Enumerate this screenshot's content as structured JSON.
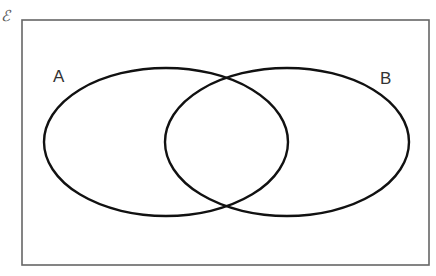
{
  "diagram": {
    "type": "venn",
    "universal_set_symbol": "ℰ",
    "universal_set": {
      "x": 22,
      "y": 20,
      "width": 407,
      "height": 245,
      "stroke": "#666666"
    },
    "sets": [
      {
        "label": "A",
        "cx": 166,
        "cy": 142,
        "rx": 122,
        "ry": 74
      },
      {
        "label": "B",
        "cx": 287,
        "cy": 142,
        "rx": 122,
        "ry": 74
      }
    ],
    "set_stroke": "#111111",
    "background": "#ffffff"
  }
}
